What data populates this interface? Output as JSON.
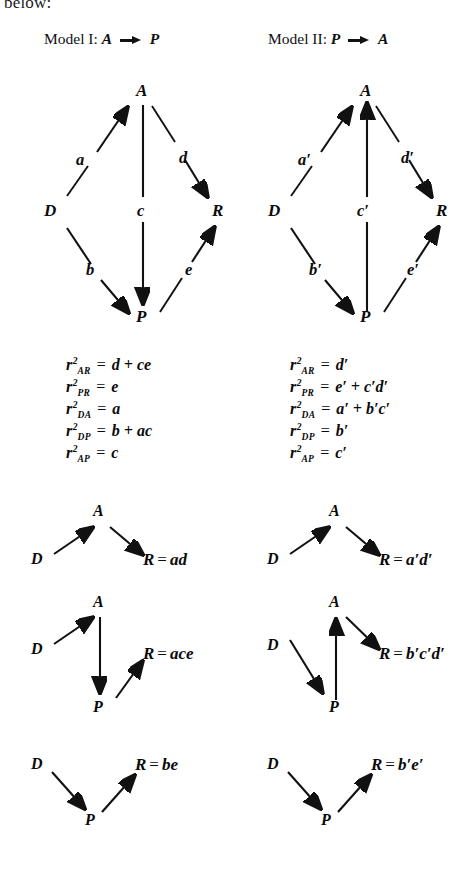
{
  "page": {
    "cut_text": "below:"
  },
  "models": [
    {
      "id": "model-1",
      "title_prefix": "Model I:",
      "title_from": "A",
      "title_to": "P",
      "nodes": {
        "top": "A",
        "left": "D",
        "right": "R",
        "bottom": "P"
      },
      "edge_labels": {
        "a": "a",
        "b": "b",
        "c": "c",
        "d": "d",
        "e": "e"
      },
      "equations": [
        {
          "sym": "r",
          "sup": "2",
          "sub": "AR",
          "rhs": "d + ce"
        },
        {
          "sym": "r",
          "sup": "2",
          "sub": "PR",
          "rhs": "e"
        },
        {
          "sym": "r",
          "sup": "2",
          "sub": "DA",
          "rhs": "a"
        },
        {
          "sym": "r",
          "sup": "2",
          "sub": "DP",
          "rhs": "b + ac"
        },
        {
          "sym": "r",
          "sup": "2",
          "sub": "AP",
          "rhs": "c"
        }
      ],
      "paths": [
        {
          "id": "path-1",
          "nodes": {
            "A": "A",
            "D": "D",
            "R": "R"
          },
          "result": "ad"
        },
        {
          "id": "path-2",
          "nodes": {
            "A": "A",
            "D": "D",
            "R": "R",
            "P": "P"
          },
          "result": "ace"
        },
        {
          "id": "path-3",
          "nodes": {
            "D": "D",
            "R": "R",
            "P": "P"
          },
          "result": "be"
        }
      ]
    },
    {
      "id": "model-2",
      "title_prefix": "Model II:",
      "title_from": "P",
      "title_to": "A",
      "nodes": {
        "top": "A",
        "left": "D",
        "right": "R",
        "bottom": "P"
      },
      "edge_labels": {
        "a": "a′",
        "b": "b′",
        "c": "c′",
        "d": "d′",
        "e": "e′"
      },
      "equations": [
        {
          "sym": "r",
          "sup": "2",
          "sub": "AR",
          "rhs": "d′"
        },
        {
          "sym": "r",
          "sup": "2",
          "sub": "PR",
          "rhs": "e′ + c′d′"
        },
        {
          "sym": "r",
          "sup": "2",
          "sub": "DA",
          "rhs": "a′ + b′c′"
        },
        {
          "sym": "r",
          "sup": "2",
          "sub": "DP",
          "rhs": "b′"
        },
        {
          "sym": "r",
          "sup": "2",
          "sub": "AP",
          "rhs": "c′"
        }
      ],
      "paths": [
        {
          "id": "path-1",
          "nodes": {
            "A": "A",
            "D": "D",
            "R": "R"
          },
          "result": "a′d′"
        },
        {
          "id": "path-2",
          "nodes": {
            "A": "A",
            "D": "D",
            "R": "R",
            "P": "P"
          },
          "result": "b′c′d′"
        },
        {
          "id": "path-3",
          "nodes": {
            "D": "D",
            "R": "R",
            "P": "P"
          },
          "result": "b′e′"
        }
      ]
    }
  ],
  "equals_sign": "=",
  "plus_sign": "+",
  "colors": {
    "ink": "#0a0a0a",
    "background": "#ffffff"
  }
}
